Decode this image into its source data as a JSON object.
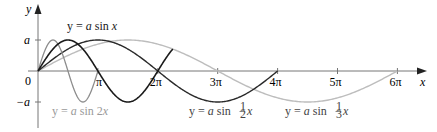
{
  "chart_data": {
    "type": "line",
    "title": "",
    "xlabel": "x",
    "ylabel": "y",
    "origin_label": "0",
    "x_ticks": [
      {
        "value": 1,
        "label": "π"
      },
      {
        "value": 2,
        "label": "2π"
      },
      {
        "value": 3,
        "label": "3π"
      },
      {
        "value": 4,
        "label": "4π"
      },
      {
        "value": 5,
        "label": "5π"
      },
      {
        "value": 6,
        "label": "6π"
      }
    ],
    "x_unit": "π",
    "y_ticks": [
      {
        "value": 1,
        "label": "a"
      },
      {
        "value": -1,
        "label": "−a"
      }
    ],
    "xlim": [
      0,
      6.4
    ],
    "ylim": [
      -1.6,
      2.1
    ],
    "grid": false,
    "legend": "inline labels",
    "series": [
      {
        "name": "y = a sin x",
        "frequency": 1,
        "x_range_pi": [
          0,
          2.25
        ],
        "color": "#1a1a1a",
        "width": 1.6
      },
      {
        "name": "y = a sin 2x",
        "frequency": 2,
        "x_range_pi": [
          0,
          1.0
        ],
        "color": "#8c8c8c",
        "width": 1.3
      },
      {
        "name": "y = a sin ½x",
        "frequency": 0.5,
        "x_range_pi": [
          0,
          4
        ],
        "color": "#2a2a2a",
        "width": 1.4
      },
      {
        "name": "y = a sin ⅓x",
        "frequency": 0.3333333,
        "x_range_pi": [
          0,
          6
        ],
        "color": "#bdbdbd",
        "width": 1.4
      }
    ]
  },
  "labels": {
    "sin_x": {
      "prefix": "y = ",
      "a": "a",
      "mid": " sin ",
      "var": "x"
    },
    "sin_2x": {
      "prefix": "y = ",
      "a": "a",
      "mid": " sin 2",
      "var": "x"
    },
    "sin_half": {
      "prefix": "y = ",
      "a": "a",
      "mid": " sin ",
      "num": "1",
      "den": "2",
      "var": "x"
    },
    "sin_third": {
      "prefix": "y = ",
      "a": "a",
      "mid": " sin ",
      "num": "1",
      "den": "3",
      "var": "x"
    }
  },
  "axes": {
    "x_label": "x",
    "y_label": "y",
    "origin": "0",
    "a_label": "a",
    "neg_a_label": "−a",
    "pi_labels": [
      "π",
      "2π",
      "3π",
      "4π",
      "5π",
      "6π"
    ]
  }
}
